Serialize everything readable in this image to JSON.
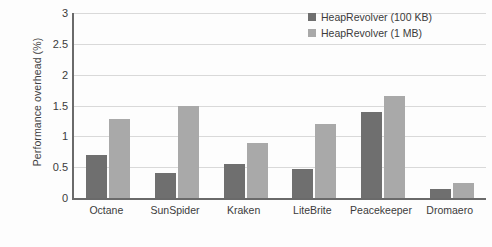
{
  "chart_data": {
    "type": "bar",
    "title": "",
    "xlabel": "",
    "ylabel": "Performance overhead (%)",
    "ylim": [
      0,
      3
    ],
    "yticks": [
      0,
      0.5,
      1,
      1.5,
      2,
      2.5,
      3
    ],
    "ytick_labels": [
      "0",
      "0.5",
      "1",
      "1.5",
      "2",
      "2.5",
      "3"
    ],
    "grid": true,
    "legend_position": "top-right",
    "categories": [
      "Octane",
      "SunSpider",
      "Kraken",
      "LiteBrite",
      "Peacekeeper",
      "Dromaero"
    ],
    "series": [
      {
        "name": "HeapRevolver (100 KB)",
        "color": "#6f6f6f",
        "values": [
          0.7,
          0.4,
          0.55,
          0.47,
          1.39,
          0.14
        ]
      },
      {
        "name": "HeapRevolver (1 MB)",
        "color": "#a9a9a9",
        "values": [
          1.28,
          1.5,
          0.9,
          1.2,
          1.65,
          0.24
        ]
      }
    ]
  },
  "colors": {
    "series_dark": "#6f6f6f",
    "series_light": "#a9a9a9",
    "axis": "#6a6a6a",
    "gridline": "#d9d9d9",
    "text": "#3b3b3b",
    "background": "#fdfdfd"
  }
}
